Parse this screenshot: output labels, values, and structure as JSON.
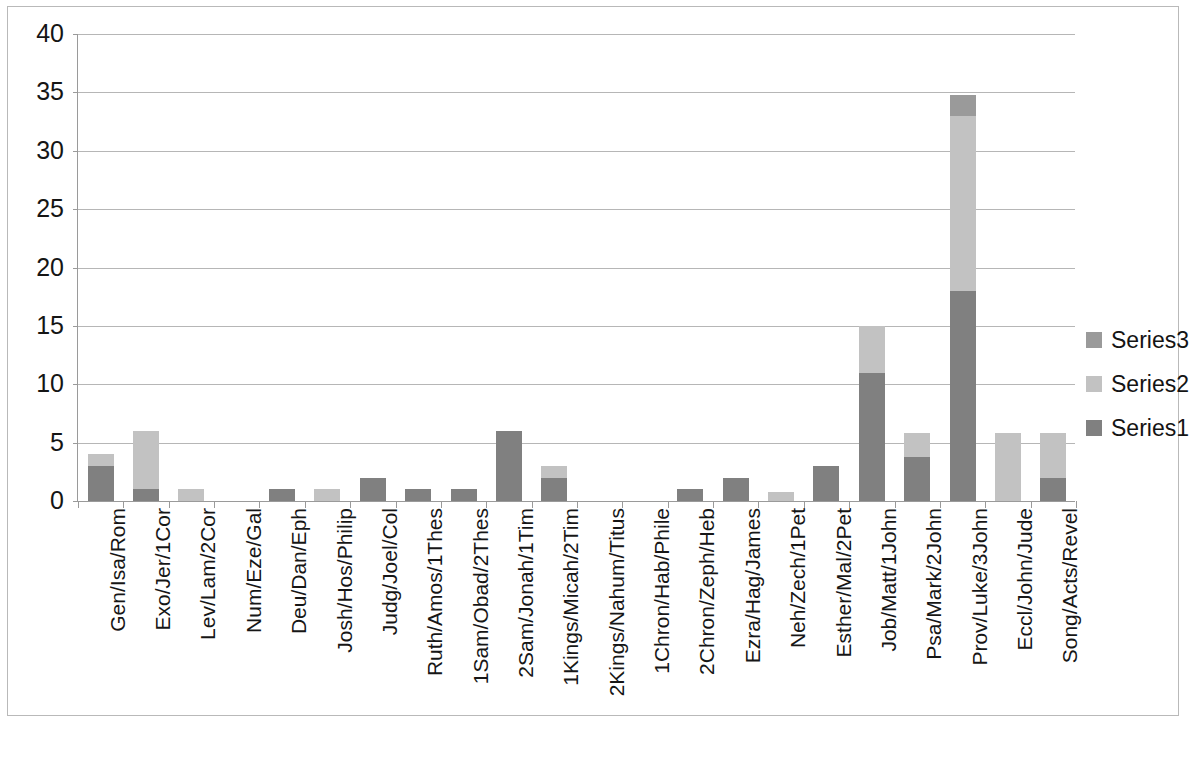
{
  "chart_data": {
    "type": "bar",
    "subtype": "stacked-column",
    "title": "",
    "xlabel": "",
    "ylabel": "",
    "ylim": [
      0,
      40
    ],
    "ytick_step": 5,
    "yticks": [
      0,
      5,
      10,
      15,
      20,
      25,
      30,
      35,
      40
    ],
    "grid": true,
    "legend_position": "right",
    "categories": [
      "Gen/Isa/Rom",
      "Exo/Jer/1Cor",
      "Lev/Lam/2Cor",
      "Num/Eze/Gal",
      "Deu/Dan/Eph",
      "Josh/Hos/Philip",
      "Judg/Joel/Col",
      "Ruth/Amos/1Thes",
      "1Sam/Obad/2Thes",
      "2Sam/Jonah/1Tim",
      "1Kings/Micah/2Tim",
      "2Kings/Nahum/Titus",
      "1Chron/Hab/Phile",
      "2Chron/Zeph/Heb",
      "Ezra/Hag/James",
      "Neh/Zech/1Pet",
      "Esther/Mal/2Pet",
      "Job/Matt/1John",
      "Psa/Mark/2John",
      "Prov/Luke/3John",
      "Eccl/John/Jude",
      "Song/Acts/Revel"
    ],
    "series": [
      {
        "name": "Series1",
        "color": "#808080",
        "values": [
          3,
          1,
          0,
          0,
          1,
          0,
          2,
          1,
          1,
          6,
          2,
          0,
          0,
          1,
          2,
          0,
          3,
          11,
          3.8,
          18,
          0,
          2
        ]
      },
      {
        "name": "Series2",
        "color": "#c2c2c2",
        "values": [
          1,
          5,
          1,
          0,
          0,
          1,
          0,
          0,
          0,
          0,
          1,
          0,
          0,
          0,
          0,
          0.8,
          0,
          4,
          2,
          15,
          5.8,
          3.8
        ]
      },
      {
        "name": "Series3",
        "color": "#9a9a9a",
        "values": [
          0,
          0,
          0,
          0,
          0,
          0,
          0,
          0,
          0,
          0,
          0,
          0,
          0,
          0,
          0,
          0,
          0,
          0,
          0,
          1.8,
          0,
          0
        ]
      }
    ],
    "totals": [
      4,
      6,
      1,
      0,
      1,
      1,
      2,
      1,
      1,
      6,
      3,
      0,
      0,
      1,
      2,
      0.8,
      3,
      15,
      5.8,
      34.8,
      5.8,
      5.8
    ]
  },
  "legend": {
    "items": [
      {
        "label": "Series3",
        "color": "#9a9a9a"
      },
      {
        "label": "Series2",
        "color": "#c2c2c2"
      },
      {
        "label": "Series1",
        "color": "#808080"
      }
    ]
  },
  "colors": {
    "series1": "#808080",
    "series2": "#c2c2c2",
    "series3": "#9a9a9a",
    "gridline": "#b6b6b6",
    "axis": "#9a9a9a",
    "frame": "#b9b9b9",
    "text": "#141414",
    "background": "#ffffff"
  },
  "footer": {
    "artifact_text": ""
  }
}
